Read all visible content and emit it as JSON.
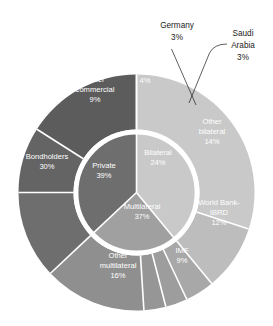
{
  "chart_data": {
    "type": "pie",
    "title": "",
    "subtitle": "",
    "xlabel": "",
    "ylabel": "",
    "legend_position": "none",
    "grid": false,
    "variant": "two-level-donut-sunburst",
    "units": "percent",
    "rings": [
      {
        "name": "inner",
        "categories": [
          "Private",
          "Bilateral",
          "Multilateral"
        ],
        "values": [
          39,
          24,
          37
        ],
        "colors": [
          "#c9c9c9",
          "#a0a0a0",
          "#6e6e6e"
        ]
      },
      {
        "name": "outer",
        "categories": [
          "Bondholders",
          "Other commercial",
          "Japan",
          "Germany",
          "Saudi Arabia",
          "Other bilateral",
          "World Bank-IBRD",
          "IMF",
          "Other multilateral"
        ],
        "values": [
          30,
          9,
          4,
          3,
          3,
          14,
          12,
          9,
          16
        ],
        "colors": [
          "#c9c9c9",
          "#bdbdbd",
          "#a8a8a8",
          "#9d9d9d",
          "#969696",
          "#8f8f8f",
          "#6e6e6e",
          "#646464",
          "#5c5c5c"
        ],
        "parents": [
          "Private",
          "Private",
          "Bilateral",
          "Bilateral",
          "Bilateral",
          "Bilateral",
          "Multilateral",
          "Multilateral",
          "Multilateral"
        ]
      }
    ],
    "inner_labels": [
      {
        "name": "private",
        "text": "Private",
        "value": "39%"
      },
      {
        "name": "bilateral",
        "text": "Bilateral",
        "value": "24%"
      },
      {
        "name": "multilateral",
        "text": "Multilateral",
        "value": "37%"
      }
    ],
    "outer_labels": [
      {
        "name": "bondholders",
        "line1": "Bondholders",
        "line2": "",
        "value": "30%"
      },
      {
        "name": "other-commercial",
        "line1": "Other",
        "line2": "commercial",
        "value": "9%"
      },
      {
        "name": "japan",
        "line1": "Japan",
        "line2": "",
        "value": "4%"
      },
      {
        "name": "other-bilateral",
        "line1": "Other",
        "line2": "bilateral",
        "value": "14%"
      },
      {
        "name": "world-bank-ibrd",
        "line1": "World Bank-",
        "line2": "IBRD",
        "value": "12%"
      },
      {
        "name": "imf",
        "line1": "IMF",
        "line2": "",
        "value": "9%"
      },
      {
        "name": "other-multilateral",
        "line1": "Other",
        "line2": "multilateral",
        "value": "16%"
      }
    ],
    "callouts": [
      {
        "name": "germany",
        "line1": "Germany",
        "value": "3%"
      },
      {
        "name": "saudi-arabia",
        "line1": "Saudi",
        "line2": "Arabia",
        "value": "3%"
      }
    ],
    "colors": {
      "private_light": "#c9c9c9",
      "bilateral_medium": "#a0a0a0",
      "multilateral_dark": "#6e6e6e",
      "separator": "#ffffff",
      "label_light": "#ffffff",
      "label_dark": "#1a1a1a",
      "background": "#ffffff"
    }
  },
  "labels": {
    "private_name": "Private",
    "private_value": "39%",
    "bilateral_name": "Bilateral",
    "bilateral_value": "24%",
    "multilateral_name": "Multilateral",
    "multilateral_value": "37%",
    "bondholders_name": "Bondholders",
    "bondholders_value": "30%",
    "other_commercial_l1": "Other",
    "other_commercial_l2": "commercial",
    "other_commercial_value": "9%",
    "japan_name": "Japan",
    "japan_value": "4%",
    "germany_name": "Germany",
    "germany_value": "3%",
    "saudi_l1": "Saudi",
    "saudi_l2": "Arabia",
    "saudi_value": "3%",
    "other_bilateral_l1": "Other",
    "other_bilateral_l2": "bilateral",
    "other_bilateral_value": "14%",
    "world_bank_l1": "World Bank-",
    "world_bank_l2": "IBRD",
    "world_bank_value": "12%",
    "imf_name": "IMF",
    "imf_value": "9%",
    "other_multilateral_l1": "Other",
    "other_multilateral_l2": "multilateral",
    "other_multilateral_value": "16%"
  }
}
